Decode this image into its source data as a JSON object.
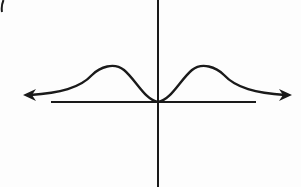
{
  "figure": {
    "label_fragment": "(",
    "description": "Graph of an even function with two symmetric humps touching the origin, approaching the horizontal axis asymptotically in both directions",
    "colors": {
      "ink": "#1a1a1a",
      "background": "#fdfdfd"
    },
    "axes": {
      "x_axis": {
        "y": 102,
        "x_start": 51,
        "x_end": 256,
        "arrows": false
      },
      "y_axis": {
        "x": 158,
        "y_start": 0,
        "y_end": 187,
        "arrows": false
      }
    },
    "curve": {
      "symmetric_about": "y-axis",
      "min_point": {
        "x": 158,
        "y": 102
      },
      "left_peak": {
        "x": 107,
        "y": 66
      },
      "right_peak": {
        "x": 208,
        "y": 66
      },
      "left_end_arrow": {
        "x": 24,
        "y": 95
      },
      "right_end_arrow": {
        "x": 291,
        "y": 95
      }
    }
  }
}
